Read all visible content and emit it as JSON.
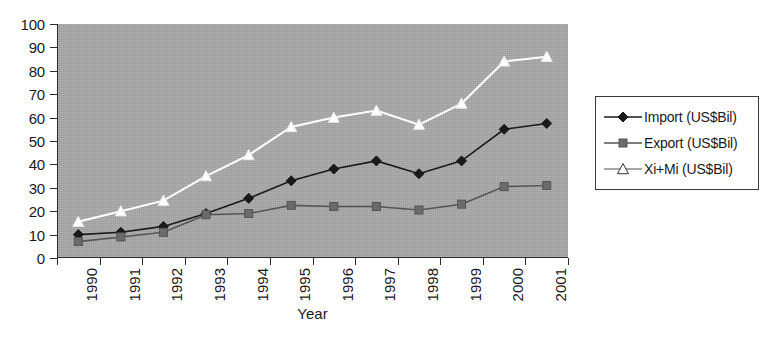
{
  "chart_data": {
    "type": "line",
    "title": "",
    "xlabel": "Year",
    "ylabel": "",
    "categories": [
      "1990",
      "1991",
      "1992",
      "1993",
      "1994",
      "1995",
      "1996",
      "1997",
      "1998",
      "1999",
      "2000",
      "2001"
    ],
    "ylim": [
      0,
      100
    ],
    "ytick_step": 10,
    "yticks": [
      "100",
      "90",
      "80",
      "70",
      "60",
      "50",
      "40",
      "30",
      "20",
      "10",
      "0"
    ],
    "grid": false,
    "legend_position": "right",
    "plot_background": "#a9a9a9",
    "series": [
      {
        "name": "Import (US$Bil)",
        "marker": "diamond",
        "color": "#1a1a1a",
        "marker_fill": "#1a1a1a",
        "values": [
          10,
          11,
          13.5,
          19,
          25.5,
          33,
          38,
          41.5,
          36,
          41.5,
          55,
          57.5
        ]
      },
      {
        "name": "Export (US$Bil)",
        "marker": "square",
        "color": "#555555",
        "marker_fill": "#6b6b6b",
        "values": [
          7,
          9,
          11,
          18.5,
          19,
          22.5,
          22,
          22,
          20.5,
          23,
          30.5,
          31
        ]
      },
      {
        "name": "Xi+Mi (US$Bil)",
        "marker": "triangle",
        "color": "#ffffff",
        "marker_fill": "#ffffff",
        "values": [
          15.5,
          20,
          24.5,
          35,
          44,
          56,
          60,
          63,
          57,
          66,
          84,
          86
        ]
      }
    ]
  }
}
